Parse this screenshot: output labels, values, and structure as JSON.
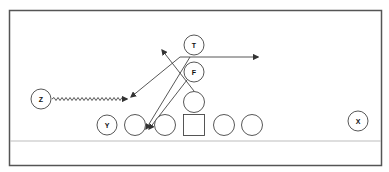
{
  "diagram": {
    "type": "football-play",
    "colors": {
      "frame": "#555555",
      "line_of_scrimmage": "#bdbdbd",
      "player_stroke": "#444444",
      "route": "#444444"
    },
    "labeled_players": [
      {
        "id": "T",
        "label": "T"
      },
      {
        "id": "F",
        "label": "F"
      },
      {
        "id": "Z",
        "label": "Z"
      },
      {
        "id": "Y",
        "label": "Y"
      },
      {
        "id": "X",
        "label": "X"
      }
    ],
    "unlabeled_players": [
      "QB",
      "LG",
      "RT-side lineman 1",
      "Center (square)",
      "RG",
      "RT"
    ],
    "routes": [
      {
        "from": "T",
        "description": "flat route to the right"
      },
      {
        "from": "T",
        "description": "diagonal to left toward Z"
      },
      {
        "from": "QB",
        "description": "drop back up-left"
      },
      {
        "from": "F",
        "description": "run toward left guard gap"
      },
      {
        "from": "Z",
        "description": "motion (zigzag) toward formation"
      }
    ]
  }
}
